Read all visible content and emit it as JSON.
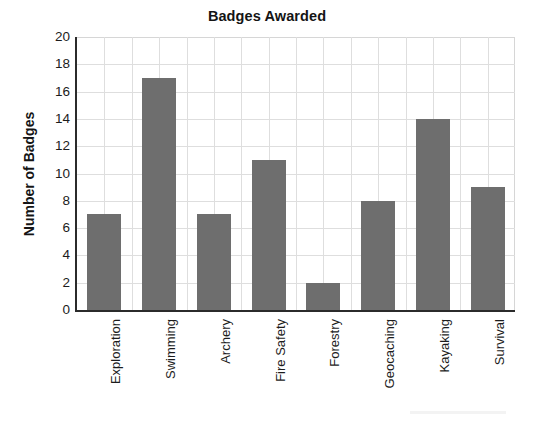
{
  "chart_data": {
    "type": "bar",
    "title": "Badges Awarded",
    "xlabel": "",
    "ylabel": "Number of Badges",
    "categories": [
      "Exploration",
      "Swimming",
      "Archery",
      "Fire Safety",
      "Forestry",
      "Geocaching",
      "Kayaking",
      "Survival"
    ],
    "values": [
      7,
      17,
      7,
      11,
      2,
      8,
      14,
      9
    ],
    "ylim": [
      0,
      20
    ],
    "ytick_step": 2,
    "yticks": [
      20,
      18,
      16,
      14,
      12,
      10,
      8,
      6,
      4,
      2,
      0
    ],
    "grid": true,
    "grid_axes": "both",
    "legend": "none",
    "bar_color": "#6e6e6e",
    "grid_color": "#dedede",
    "axis_color": "#2b2b2b",
    "text_color": "#1c1c1c"
  }
}
